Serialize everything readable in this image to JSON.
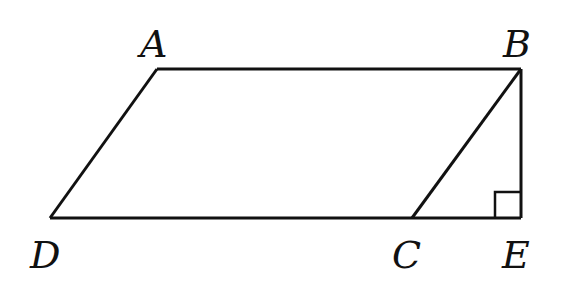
{
  "diagram": {
    "type": "geometry",
    "points": {
      "A": {
        "label": "A",
        "x": 157,
        "y": 69
      },
      "B": {
        "label": "B",
        "x": 521,
        "y": 69
      },
      "C": {
        "label": "C",
        "x": 412,
        "y": 218
      },
      "D": {
        "label": "D",
        "x": 50,
        "y": 218
      },
      "E": {
        "label": "E",
        "x": 521,
        "y": 218
      }
    },
    "segments": [
      "AB",
      "BC",
      "CD",
      "DA",
      "BE",
      "CE"
    ],
    "right_angle_at": "E",
    "colors": {
      "stroke": "#111111",
      "background": "#ffffff"
    }
  }
}
